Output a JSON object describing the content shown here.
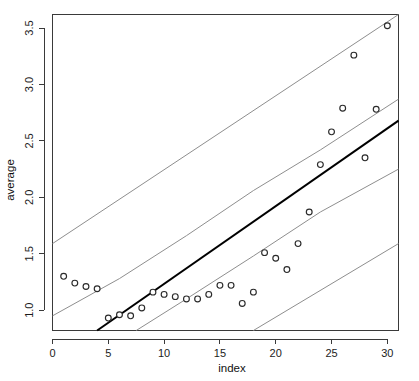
{
  "chart_data": {
    "type": "scatter",
    "title": "",
    "xlabel": "index",
    "ylabel": "average",
    "xlim": [
      0,
      31
    ],
    "ylim": [
      0.82,
      3.62
    ],
    "grid": false,
    "legend": null,
    "xticks": [
      0,
      5,
      10,
      15,
      20,
      25,
      30
    ],
    "xtick_labels": [
      "0",
      "5",
      "10",
      "15",
      "20",
      "25",
      "30"
    ],
    "yticks": [
      1.0,
      1.5,
      2.0,
      2.5,
      3.0,
      3.5
    ],
    "ytick_labels": [
      "1.0",
      "1.5",
      "2.0",
      "2.5",
      "3.0",
      "3.5"
    ],
    "x": [
      1,
      2,
      3,
      4,
      5,
      6,
      7,
      8,
      9,
      10,
      11,
      12,
      13,
      14,
      15,
      16,
      17,
      18,
      19,
      20,
      21,
      22,
      23,
      24,
      25,
      26,
      27,
      28,
      29,
      30
    ],
    "values": [
      1.3,
      1.24,
      1.21,
      1.19,
      0.93,
      0.96,
      0.95,
      1.02,
      1.16,
      1.14,
      1.12,
      1.1,
      1.1,
      1.14,
      1.22,
      1.22,
      1.06,
      1.16,
      1.51,
      1.46,
      1.36,
      1.59,
      1.87,
      2.29,
      2.58,
      2.79,
      3.26,
      2.35,
      2.78,
      3.52
    ],
    "series": [
      {
        "name": "observed average",
        "type": "scatter",
        "marker": "open-circle",
        "color": "#2b2b2b",
        "values": [
          1.3,
          1.24,
          1.21,
          1.19,
          0.93,
          0.96,
          0.95,
          1.02,
          1.16,
          1.14,
          1.12,
          1.1,
          1.1,
          1.14,
          1.22,
          1.22,
          1.06,
          1.16,
          1.51,
          1.46,
          1.36,
          1.59,
          1.87,
          2.29,
          2.58,
          2.79,
          3.26,
          2.35,
          2.78,
          3.52
        ]
      },
      {
        "name": "fitted regression line",
        "type": "line",
        "color": "#000000",
        "x": [
          4.0,
          31.0
        ],
        "values": [
          0.82,
          2.68
        ]
      },
      {
        "name": "outer upper band",
        "type": "line",
        "color": "#8e8e8e",
        "x": [
          0.0,
          31.0
        ],
        "values": [
          1.59,
          3.62
        ]
      },
      {
        "name": "inner upper band",
        "type": "line",
        "color": "#8e8e8e",
        "x": [
          0.0,
          6.0,
          12.0,
          18.0,
          24.0,
          31.0
        ],
        "values": [
          0.95,
          1.28,
          1.66,
          2.06,
          2.42,
          2.87
        ]
      },
      {
        "name": "inner lower band",
        "type": "line",
        "color": "#8e8e8e",
        "x": [
          7.5,
          12.0,
          18.0,
          24.0,
          31.0
        ],
        "values": [
          0.82,
          1.1,
          1.48,
          1.87,
          2.25
        ]
      },
      {
        "name": "outer lower band",
        "type": "line",
        "color": "#8e8e8e",
        "x": [
          18.0,
          31.0
        ],
        "values": [
          0.82,
          1.59
        ]
      }
    ]
  },
  "axes": {
    "x_title": "index",
    "y_title": "average"
  },
  "colors": {
    "background": "#ffffff",
    "axis": "#3a3a3a",
    "fit_line": "#000000",
    "band_line": "#8e8e8e",
    "marker_stroke": "#2b2b2b",
    "marker_fill": "#ffffff",
    "text": "#1c1c1c"
  }
}
